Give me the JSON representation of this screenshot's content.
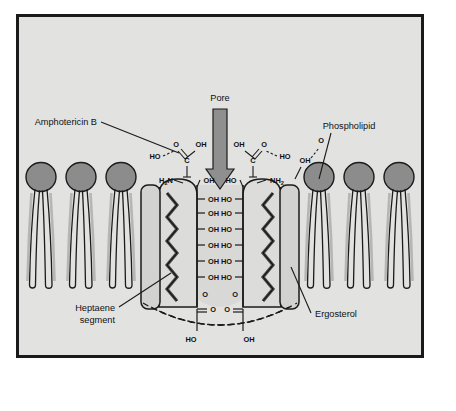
{
  "figure": {
    "title_absent": true,
    "background_color": "#e2e2e0",
    "frame_color": "#1a1a1a",
    "lipid_head_color": "#8c8c8c",
    "lipid_tail_color": "#b0b0b0",
    "sterol_fill": "#d2d2d0",
    "pore_arrow_color": "#8f8f8f",
    "amphotericin_fill": "#dcdcda"
  },
  "labels": {
    "amphotericin": "Amphotericin B",
    "pore": "Pore",
    "phospholipid": "Phospholipid",
    "heptaene_line1": "Heptaene",
    "heptaene_line2": "segment",
    "ergosterol": "Ergosterol"
  },
  "chem": {
    "hydroxyl": "OH",
    "hydroxyl_rev": "HO",
    "carbon": "C",
    "oxygen": "O",
    "amine_left": "H",
    "amine_left_sub": "2",
    "amine_left_n": "N",
    "amine_right": "NH",
    "amine_right_sub": "2",
    "pore_lining_left": [
      "OH",
      "OH",
      "OH",
      "OH",
      "OH",
      "OH"
    ],
    "pore_lining_right": [
      "HO",
      "HO",
      "HO",
      "HO",
      "HO",
      "HO"
    ],
    "bottom_left": "HO",
    "bottom_right": "OH",
    "top_left_ho": "HO",
    "top_left_o": "O",
    "top_left_oh": "OH",
    "top_right_ho": "HO",
    "top_right_o": "O",
    "top_right_oh": "OH",
    "neck_left_oh": "OH",
    "neck_right_ho": "HO",
    "right_edge_oh": "OH",
    "carbonyl_left_o_up": "O",
    "carbonyl_left_o_side": "O",
    "carbonyl_right_o_up": "O",
    "carbonyl_right_o_side": "O"
  },
  "counts": {
    "phospholipids_left": 3,
    "phospholipids_right": 3,
    "pore_lining_rows": 6,
    "sterols": 2
  }
}
